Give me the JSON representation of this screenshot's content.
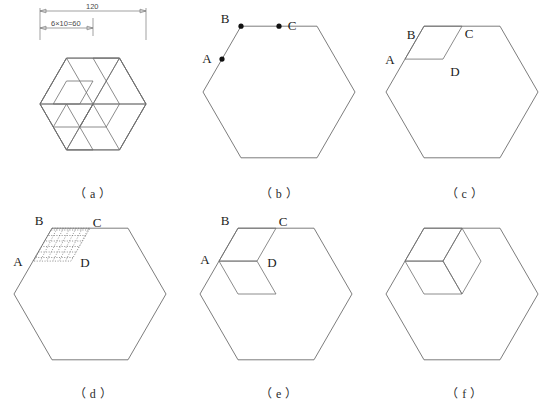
{
  "figure": {
    "title_note": "hexagonal pinwheel tiling construction, six panels",
    "line_color": "#6e6e6e",
    "label_color": "#1c1c1c",
    "background": "#ffffff"
  },
  "panels": [
    {
      "id": "a",
      "caption": "（ a ）",
      "kind": "tiling",
      "point_labels": [],
      "dimensions": [
        {
          "name": "overall-width",
          "text": "120"
        },
        {
          "name": "half-width-divisions",
          "text": "6×10=60"
        }
      ]
    },
    {
      "id": "b",
      "caption": "（ b ）",
      "kind": "hexagon-with-points",
      "point_labels": [
        "A",
        "B",
        "C"
      ],
      "dimensions": []
    },
    {
      "id": "c",
      "caption": "（ c ）",
      "kind": "hexagon-one-diagonal-hatch",
      "point_labels": [
        "A",
        "B",
        "C",
        "D"
      ],
      "dimensions": []
    },
    {
      "id": "d",
      "caption": "（ d ）",
      "kind": "hexagon-dotted-grid",
      "point_labels": [
        "A",
        "B",
        "C",
        "D"
      ],
      "dimensions": []
    },
    {
      "id": "e",
      "caption": "（ e ）",
      "kind": "hexagon-two-hatched-cells",
      "point_labels": [
        "A",
        "B",
        "C",
        "D"
      ],
      "dimensions": []
    },
    {
      "id": "f",
      "caption": "（ f ）",
      "kind": "hexagon-three-hatched-cells",
      "point_labels": [],
      "dimensions": []
    }
  ]
}
